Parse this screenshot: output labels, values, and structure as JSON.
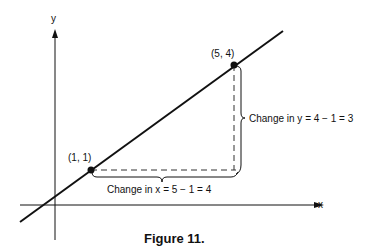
{
  "figure": {
    "caption": "Figure 11.",
    "axes": {
      "x_label": "x",
      "y_label": "y"
    },
    "points": [
      {
        "label": "(1, 1)",
        "x": 1,
        "y": 1
      },
      {
        "label": "(5, 4)",
        "x": 5,
        "y": 4
      }
    ],
    "annotations": {
      "change_x": "Change in x = 5 − 1 = 4",
      "change_y": "Change in y = 4 − 1 = 3"
    },
    "colors": {
      "ink": "#111111",
      "background": "#ffffff"
    }
  }
}
